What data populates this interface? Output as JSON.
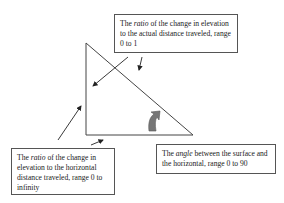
{
  "boxes": {
    "top": {
      "pre": "The ",
      "em": "ratio",
      "post": " of the change in elevation to the actual distance traveled, range 0 to 1"
    },
    "bottom_left": {
      "pre": "The ",
      "em": "ratio",
      "post": " of the change in elevation to the horizontal distance traveled, range 0 to infinity"
    },
    "bottom_right": {
      "pre": "The ",
      "em": "angle",
      "post": " between the surface and the horizontal, range 0 to 90"
    }
  },
  "colors": {
    "line": "#333333",
    "angle_arrow": "#777777"
  }
}
